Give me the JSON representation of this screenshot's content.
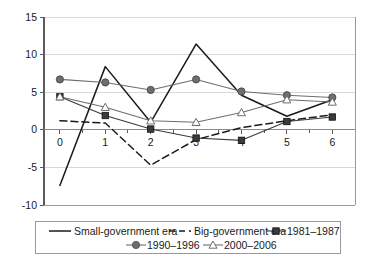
{
  "chart_data": {
    "type": "line",
    "title": "",
    "subtitle": "",
    "xlabel": "",
    "ylabel": "",
    "x": [
      0,
      1,
      2,
      3,
      4,
      5,
      6
    ],
    "xticklabels": [
      "0",
      "1",
      "2",
      "3",
      "4",
      "5",
      "6"
    ],
    "yticklabels": [
      "15",
      "10",
      "5",
      "0",
      "-5",
      "-10"
    ],
    "yticks": [
      15,
      10,
      5,
      0,
      -5,
      -10
    ],
    "xlim": [
      -0.35,
      6.5
    ],
    "ylim": [
      -10,
      15
    ],
    "grid": "horizontal",
    "legend_position": "bottom",
    "series": [
      {
        "name": "Small-government era",
        "style": "solid",
        "marker": "none",
        "color": "#1a1a1a",
        "values": [
          -7.4,
          8.4,
          1.0,
          11.4,
          4.6,
          1.8,
          4.0
        ]
      },
      {
        "name": "Big-government era",
        "style": "dashed",
        "marker": "none",
        "color": "#1a1a1a",
        "values": [
          1.2,
          0.9,
          -4.7,
          -1.3,
          0.3,
          1.2,
          2.0
        ]
      },
      {
        "name": "1981-1987",
        "style": "solid",
        "marker": "square-filled",
        "color": "#3a3a3a",
        "values": [
          4.4,
          1.9,
          0.1,
          -1.1,
          -1.4,
          1.1,
          1.7
        ]
      },
      {
        "name": "1990-1996",
        "style": "solid",
        "marker": "circle-filled",
        "color": "#6e6e6e",
        "values": [
          6.7,
          6.3,
          5.3,
          6.7,
          5.1,
          4.6,
          4.3
        ]
      },
      {
        "name": "2000-2006",
        "style": "solid",
        "marker": "triangle-open",
        "color": "#6e6e6e",
        "values": [
          4.4,
          3.0,
          1.2,
          1.0,
          2.3,
          4.0,
          3.7
        ]
      }
    ]
  },
  "legend": {
    "row1": [
      {
        "label": "Small-government era",
        "key": "small-government-era"
      },
      {
        "label": "Big-government era",
        "key": "big-government-era"
      },
      {
        "label": "1981-1987",
        "key": "1981-1987"
      }
    ],
    "row2": [
      {
        "label": "1990-1996",
        "key": "1990-1996"
      },
      {
        "label": "2000-2006",
        "key": "2000-2006"
      }
    ]
  },
  "colors": {
    "axis": "#5b5b5b",
    "grid": "#d8d8d8",
    "series_dark": "#1a1a1a",
    "series_mid": "#3a3a3a",
    "series_gray": "#6e6e6e",
    "background": "#ffffff"
  }
}
